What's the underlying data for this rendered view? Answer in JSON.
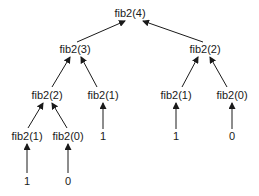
{
  "diagram": {
    "colors": {
      "background": "#ffffff",
      "text": "#1a1a1a",
      "edge": "#1a1a1a"
    },
    "nodes": [
      {
        "id": "n0",
        "label": "fib2(4)",
        "x": 130,
        "y": 13
      },
      {
        "id": "n1",
        "label": "fib2(3)",
        "x": 75,
        "y": 49
      },
      {
        "id": "n2",
        "label": "fib2(2)",
        "x": 205,
        "y": 49
      },
      {
        "id": "n3",
        "label": "fib2(2)",
        "x": 47,
        "y": 95
      },
      {
        "id": "n4",
        "label": "fib2(1)",
        "x": 103,
        "y": 95
      },
      {
        "id": "n5",
        "label": "fib2(1)",
        "x": 176,
        "y": 95
      },
      {
        "id": "n6",
        "label": "fib2(0)",
        "x": 232,
        "y": 95
      },
      {
        "id": "n7",
        "label": "fib2(1)",
        "x": 27,
        "y": 136
      },
      {
        "id": "n8",
        "label": "fib2(0)",
        "x": 68,
        "y": 136
      },
      {
        "id": "n9",
        "label": "1",
        "x": 103,
        "y": 136
      },
      {
        "id": "n10",
        "label": "1",
        "x": 176,
        "y": 136
      },
      {
        "id": "n11",
        "label": "0",
        "x": 232,
        "y": 136
      },
      {
        "id": "n12",
        "label": "1",
        "x": 27,
        "y": 181
      },
      {
        "id": "n13",
        "label": "0",
        "x": 68,
        "y": 181
      }
    ],
    "edges": [
      {
        "from": "n1",
        "to": "n0",
        "x1": 77,
        "y1": 42,
        "x2": 125,
        "y2": 21
      },
      {
        "from": "n2",
        "to": "n0",
        "x1": 203,
        "y1": 42,
        "x2": 143,
        "y2": 21
      },
      {
        "from": "n3",
        "to": "n1",
        "x1": 52,
        "y1": 87,
        "x2": 70,
        "y2": 57
      },
      {
        "from": "n4",
        "to": "n1",
        "x1": 97,
        "y1": 87,
        "x2": 81,
        "y2": 57
      },
      {
        "from": "n5",
        "to": "n2",
        "x1": 182,
        "y1": 87,
        "x2": 198,
        "y2": 57
      },
      {
        "from": "n6",
        "to": "n2",
        "x1": 227,
        "y1": 87,
        "x2": 210,
        "y2": 57
      },
      {
        "from": "n7",
        "to": "n3",
        "x1": 28,
        "y1": 128,
        "x2": 43,
        "y2": 103
      },
      {
        "from": "n8",
        "to": "n3",
        "x1": 67,
        "y1": 128,
        "x2": 52,
        "y2": 103
      },
      {
        "from": "n9",
        "to": "n4",
        "x1": 103,
        "y1": 129,
        "x2": 103,
        "y2": 103
      },
      {
        "from": "n10",
        "to": "n5",
        "x1": 176,
        "y1": 129,
        "x2": 176,
        "y2": 103
      },
      {
        "from": "n11",
        "to": "n6",
        "x1": 232,
        "y1": 129,
        "x2": 232,
        "y2": 103
      },
      {
        "from": "n12",
        "to": "n7",
        "x1": 27,
        "y1": 173,
        "x2": 27,
        "y2": 144
      },
      {
        "from": "n13",
        "to": "n8",
        "x1": 68,
        "y1": 173,
        "x2": 68,
        "y2": 144
      }
    ]
  }
}
